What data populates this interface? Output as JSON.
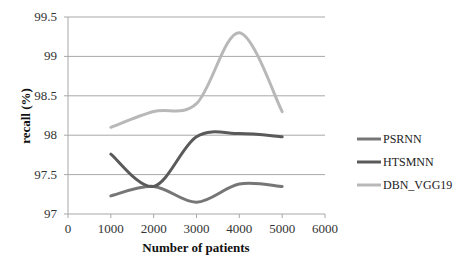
{
  "chart_data": {
    "type": "line",
    "title": "",
    "xlabel": "Number of patients",
    "ylabel": "recall (%)",
    "xlim": [
      0,
      6000
    ],
    "ylim": [
      97,
      99.5
    ],
    "x_ticks": [
      "0",
      "1000",
      "2000",
      "3000",
      "4000",
      "5000",
      "6000"
    ],
    "y_ticks": [
      "97",
      "97.5",
      "98",
      "98.5",
      "99",
      "99.5"
    ],
    "grid": "horizontal",
    "legend_position": "right",
    "smooth": true,
    "x": [
      1000,
      2000,
      3000,
      4000,
      5000
    ],
    "series": [
      {
        "name": "PSRNN",
        "color": "#767676",
        "values": [
          97.23,
          97.35,
          97.15,
          97.38,
          97.35
        ]
      },
      {
        "name": "HTSMNN",
        "color": "#5a5a5a",
        "values": [
          97.76,
          97.35,
          97.98,
          98.02,
          97.98
        ]
      },
      {
        "name": "DBN_VGG19",
        "color": "#b8b8b8",
        "values": [
          98.1,
          98.3,
          98.4,
          99.3,
          98.3
        ]
      }
    ]
  }
}
